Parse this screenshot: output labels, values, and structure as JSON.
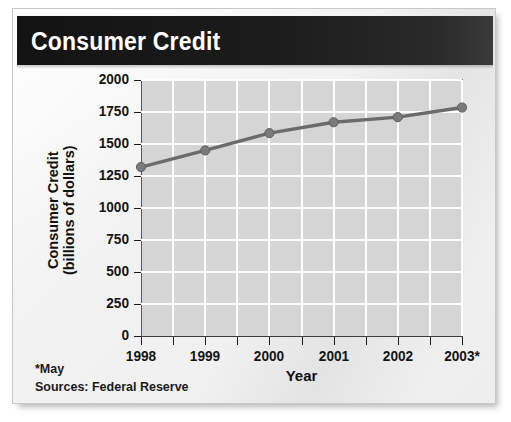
{
  "title": "Consumer Credit",
  "footnotes": {
    "asterisk_note": "*May",
    "sources": "Sources: Federal Reserve"
  },
  "colors": {
    "title_band": "#1a1a1a",
    "title_text": "#ffffff",
    "plot_background": "#d5d5d5",
    "gridline": "#fdfdfd",
    "series_line": "#6b6b6b",
    "marker": "#7a7a7a",
    "axis": "#1a1a1a",
    "card_background": "#f2f2f2"
  },
  "chart_data": {
    "type": "line",
    "title": "Consumer Credit",
    "xlabel": "Year",
    "ylabel": "Consumer Credit\n(billions of dollars)",
    "ylabel_line1": "Consumer Credit",
    "ylabel_line2": "(billions of dollars)",
    "categories": [
      "1998",
      "1999",
      "2000",
      "2001",
      "2002",
      "2003*"
    ],
    "x": [
      1998,
      1999,
      2000,
      2001,
      2002,
      2003
    ],
    "values": [
      1320,
      1450,
      1585,
      1670,
      1710,
      1785
    ],
    "series": [
      {
        "name": "Consumer Credit",
        "values": [
          1320,
          1450,
          1585,
          1670,
          1710,
          1785
        ]
      }
    ],
    "ylim": [
      0,
      2000
    ],
    "yticks": [
      2000,
      1750,
      1500,
      1250,
      1000,
      750,
      500,
      250,
      0
    ],
    "ytick_labels": [
      "2000",
      "1750",
      "1500",
      "1250",
      "1000",
      "750",
      "500",
      "250",
      "0"
    ],
    "xtick_labels": [
      "1998",
      "1999",
      "2000",
      "2001",
      "2002",
      "2003*"
    ],
    "grid": true,
    "grid_axes": "both",
    "minor_x_gridlines": true,
    "legend": false,
    "legend_position": "none",
    "markers": "circle",
    "annotations": [
      "*May",
      "Sources: Federal Reserve"
    ],
    "units": "billions of dollars"
  }
}
